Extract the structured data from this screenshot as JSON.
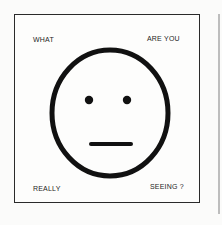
{
  "poster": {
    "text_top_left": "WHAT",
    "text_top_right": "ARE YOU",
    "text_bottom_left": "REALLY",
    "text_bottom_right": "SEEING ?",
    "illustration": "neutral-face-icon",
    "ink_color": "#111111",
    "border_color": "#2a2a2a",
    "background_color": "#fdfdfc"
  }
}
